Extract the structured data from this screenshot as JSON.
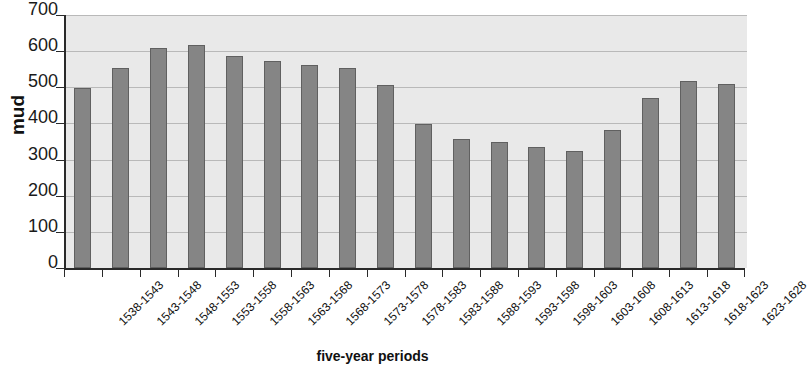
{
  "chart_data": {
    "type": "bar",
    "title": "",
    "xlabel": "five-year periods",
    "ylabel": "mud",
    "ylim": [
      0,
      700
    ],
    "ytick_step": 100,
    "yticks": [
      0,
      100,
      200,
      300,
      400,
      500,
      600,
      700
    ],
    "grid": true,
    "legend": null,
    "categories": [
      "1538-1543",
      "1543-1548",
      "1548-1553",
      "1553-1558",
      "1558-1563",
      "1563-1568",
      "1568-1573",
      "1573-1578",
      "1578-1583",
      "1583-1588",
      "1588-1593",
      "1593-1598",
      "1598-1603",
      "1603-1608",
      "1608-1613",
      "1613-1618",
      "1618-1623",
      "1623-1628"
    ],
    "values": [
      497,
      553,
      610,
      618,
      587,
      573,
      563,
      553,
      505,
      399,
      357,
      350,
      335,
      325,
      383,
      470,
      518,
      508
    ],
    "bar_color": "#858585",
    "plot_background": "#e9e9e9",
    "gridline_color": "#b9b9b9",
    "axis_color": "#2a2a2a"
  }
}
